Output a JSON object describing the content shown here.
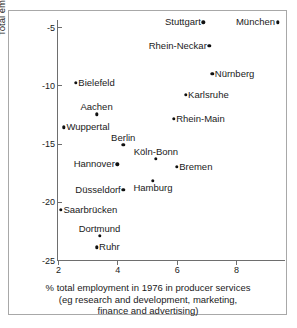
{
  "chart_data": {
    "type": "scatter",
    "title": "",
    "xlabel": "% total employment in 1976 in producer services (eg research and development, marketing, finance and advertising)",
    "ylabel": "Total employment change 1976-1986",
    "xlim": [
      2,
      8.8
    ],
    "ylim": [
      -25.8,
      -3.8
    ],
    "xticks": [
      2,
      4,
      6,
      8
    ],
    "xtick_labels": [
      "2",
      "4",
      "6",
      "8"
    ],
    "yticks": [
      -5,
      -10,
      -15,
      -20,
      -25
    ],
    "ytick_labels": [
      "-5",
      "-10",
      "-15",
      "-20",
      "-25"
    ],
    "grid": false,
    "legend": "none",
    "points": [
      {
        "label": "Stuttgart",
        "x": 6.9,
        "y": -4.6,
        "label_pos": "left"
      },
      {
        "label": "München",
        "x": 9.4,
        "y": -4.6,
        "label_pos": "left"
      },
      {
        "label": "Rhein-Neckar",
        "x": 7.1,
        "y": -6.6,
        "label_pos": "left"
      },
      {
        "label": "Nürnberg",
        "x": 7.2,
        "y": -9.0,
        "label_pos": "right"
      },
      {
        "label": "Bielefeld",
        "x": 2.6,
        "y": -9.8,
        "label_pos": "right"
      },
      {
        "label": "Karlsruhe",
        "x": 6.3,
        "y": -10.8,
        "label_pos": "right"
      },
      {
        "label": "Aachen",
        "x": 3.3,
        "y": -12.5,
        "label_pos": "above"
      },
      {
        "label": "Rhein-Main",
        "x": 5.9,
        "y": -12.9,
        "label_pos": "right"
      },
      {
        "label": "Wuppertal",
        "x": 2.2,
        "y": -13.6,
        "label_pos": "right"
      },
      {
        "label": "Berlin",
        "x": 4.2,
        "y": -15.1,
        "label_pos": "above"
      },
      {
        "label": "Köln-Bonn",
        "x": 5.3,
        "y": -16.3,
        "label_pos": "above"
      },
      {
        "label": "Hannover",
        "x": 4.0,
        "y": -16.8,
        "label_pos": "left"
      },
      {
        "label": "Bremen",
        "x": 6.0,
        "y": -17.0,
        "label_pos": "right"
      },
      {
        "label": "Hamburg",
        "x": 5.2,
        "y": -18.2,
        "label_pos": "below"
      },
      {
        "label": "Düsseldorf",
        "x": 4.2,
        "y": -19.0,
        "label_pos": "left"
      },
      {
        "label": "Saarbrücken",
        "x": 2.1,
        "y": -20.7,
        "label_pos": "right"
      },
      {
        "label": "Dortmund",
        "x": 3.4,
        "y": -22.9,
        "label_pos": "above"
      },
      {
        "label": "Ruhr",
        "x": 3.3,
        "y": -23.9,
        "label_pos": "right"
      }
    ]
  },
  "axis": {
    "y_title": "Total employment change 1976-1986",
    "x_caption_lines": [
      "% total employment in 1976 in producer services",
      "(eg research and development, marketing,",
      "finance and advertising)"
    ]
  },
  "colors": {
    "marker": "#111111",
    "axis": "#6e6e6e",
    "frame": "#a8a8a8",
    "text": "#1a1a1a",
    "background": "#ffffff"
  }
}
